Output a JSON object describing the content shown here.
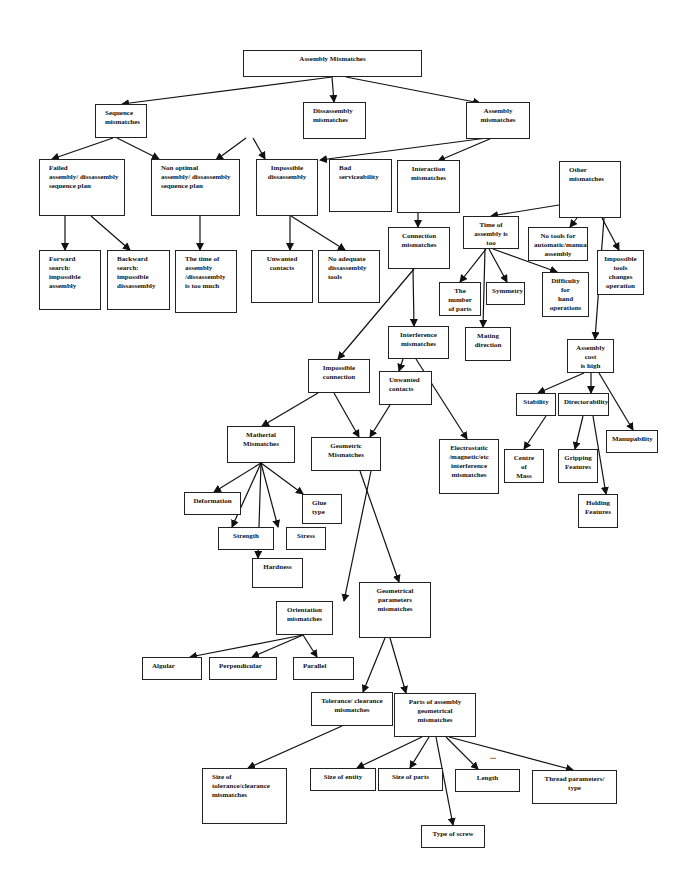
{
  "diagram": {
    "title": "Assembly Mismatches",
    "nodes": [
      {
        "id": "root",
        "label": "Assembly Mismatches",
        "x": 243,
        "y": 50,
        "w": 179,
        "h": 27,
        "align": "c"
      },
      {
        "id": "seq",
        "label": "Sequence\nmismatches",
        "x": 95,
        "y": 104,
        "w": 52,
        "h": 34,
        "align": "l"
      },
      {
        "id": "dis",
        "label": "Dissassembly\nmismatches",
        "x": 303,
        "y": 102,
        "w": 63,
        "h": 37,
        "align": "l"
      },
      {
        "id": "asm",
        "label": "Assembly\nmismatches",
        "x": 466,
        "y": 102,
        "w": 64,
        "h": 37,
        "align": "c"
      },
      {
        "id": "failed",
        "label": "Failed\nassembly/ dissassembly\nsequence plan",
        "x": 39,
        "y": 159,
        "w": 86,
        "h": 57,
        "align": "l"
      },
      {
        "id": "nonopt",
        "label": "Non optimal\nassembly/ dissassembly\nsequence plan",
        "x": 151,
        "y": 159,
        "w": 89,
        "h": 57,
        "align": "l"
      },
      {
        "id": "impdis",
        "label": "Impossible\ndissassembly",
        "x": 256,
        "y": 159,
        "w": 62,
        "h": 57,
        "align": "c"
      },
      {
        "id": "badserv",
        "label": "Bad\nserviceability",
        "x": 329,
        "y": 159,
        "w": 63,
        "h": 53,
        "align": "l"
      },
      {
        "id": "inter",
        "label": "Interaction\nmismatches",
        "x": 397,
        "y": 160,
        "w": 63,
        "h": 53,
        "align": "c"
      },
      {
        "id": "other",
        "label": "Other\nmismatches",
        "x": 559,
        "y": 161,
        "w": 62,
        "h": 57,
        "align": "l"
      },
      {
        "id": "fwd",
        "label": "Forward\nsearch:\nimpossible\nassembly",
        "x": 39,
        "y": 250,
        "w": 62,
        "h": 60,
        "align": "l"
      },
      {
        "id": "bwd",
        "label": "Backward\nsearch:\nimpossible\ndissassembly",
        "x": 107,
        "y": 250,
        "w": 63,
        "h": 60,
        "align": "l"
      },
      {
        "id": "timedis",
        "label": "The time of\nassembly\n/dissassembly\nis too much",
        "x": 175,
        "y": 250,
        "w": 62,
        "h": 63,
        "align": "l"
      },
      {
        "id": "unwcont1",
        "label": "Unwanted\ncontacts",
        "x": 251,
        "y": 250,
        "w": 62,
        "h": 53,
        "align": "c"
      },
      {
        "id": "noadeq",
        "label": "No adequate\ndissassembly\ntools",
        "x": 318,
        "y": 250,
        "w": 62,
        "h": 53,
        "align": "l"
      },
      {
        "id": "conn",
        "label": "Connection\nmismatches",
        "x": 388,
        "y": 227,
        "w": 62,
        "h": 42,
        "align": "c"
      },
      {
        "id": "timeasm",
        "label": "Time of\nassembly is too\nmuch",
        "x": 463,
        "y": 216,
        "w": 56,
        "h": 33,
        "align": "c"
      },
      {
        "id": "notools",
        "label": "No tools for\nautomatic/manual\nassembly",
        "x": 528,
        "y": 227,
        "w": 60,
        "h": 34,
        "align": "c"
      },
      {
        "id": "imptools",
        "label": "Impossible\ntools changes\noperation",
        "x": 597,
        "y": 250,
        "w": 47,
        "h": 45,
        "align": "c"
      },
      {
        "id": "numparts",
        "label": "The number\nof parts",
        "x": 439,
        "y": 282,
        "w": 42,
        "h": 34,
        "align": "c"
      },
      {
        "id": "symm",
        "label": "Symmetry",
        "x": 486,
        "y": 282,
        "w": 39,
        "h": 23,
        "align": "c"
      },
      {
        "id": "diffhand",
        "label": "Difficulty  for\nhand\noperations",
        "x": 542,
        "y": 272,
        "w": 47,
        "h": 45,
        "align": "c"
      },
      {
        "id": "mating",
        "label": "Mating\ndirection",
        "x": 465,
        "y": 327,
        "w": 46,
        "h": 34,
        "align": "c"
      },
      {
        "id": "interf",
        "label": "Interference\nmismatches",
        "x": 388,
        "y": 326,
        "w": 61,
        "h": 33,
        "align": "c"
      },
      {
        "id": "impconn",
        "label": "Impossible\nconnection",
        "x": 308,
        "y": 359,
        "w": 62,
        "h": 34,
        "align": "c"
      },
      {
        "id": "unwcont2",
        "label": "Unwanted\ncontacts",
        "x": 379,
        "y": 371,
        "w": 53,
        "h": 34,
        "align": "l"
      },
      {
        "id": "cost",
        "label": "Assembly cost\nis high",
        "x": 567,
        "y": 339,
        "w": 47,
        "h": 34,
        "align": "c"
      },
      {
        "id": "stab",
        "label": "Stability",
        "x": 516,
        "y": 393,
        "w": 40,
        "h": 23,
        "align": "c"
      },
      {
        "id": "direct",
        "label": "Directorability",
        "x": 558,
        "y": 393,
        "w": 51,
        "h": 23,
        "align": "c"
      },
      {
        "id": "manip",
        "label": "Manupability",
        "x": 606,
        "y": 430,
        "w": 52,
        "h": 23,
        "align": "c"
      },
      {
        "id": "centre",
        "label": "Centre of\nMass",
        "x": 504,
        "y": 449,
        "w": 40,
        "h": 34,
        "align": "c"
      },
      {
        "id": "gripping",
        "label": "Gripping\nFeatures",
        "x": 558,
        "y": 449,
        "w": 40,
        "h": 34,
        "align": "c"
      },
      {
        "id": "holding",
        "label": "Holding\nFeatures",
        "x": 578,
        "y": 494,
        "w": 40,
        "h": 34,
        "align": "c"
      },
      {
        "id": "mater",
        "label": "Matherial\nMismatches",
        "x": 227,
        "y": 426,
        "w": 68,
        "h": 37,
        "align": "c"
      },
      {
        "id": "geom",
        "label": "Geometric\nMismatches",
        "x": 311,
        "y": 437,
        "w": 70,
        "h": 34,
        "align": "c"
      },
      {
        "id": "electro",
        "label": "Electrostatic\n/magnetic/etc\ninterference\nmismatches",
        "x": 439,
        "y": 439,
        "w": 60,
        "h": 55,
        "align": "c"
      },
      {
        "id": "deform",
        "label": "Deformation",
        "x": 184,
        "y": 492,
        "w": 57,
        "h": 23,
        "align": "c"
      },
      {
        "id": "glue",
        "label": "Glue\ntype",
        "x": 302,
        "y": 494,
        "w": 40,
        "h": 30,
        "align": "l"
      },
      {
        "id": "strength",
        "label": "Strength",
        "x": 218,
        "y": 527,
        "w": 56,
        "h": 23,
        "align": "c"
      },
      {
        "id": "stress",
        "label": "Stress",
        "x": 286,
        "y": 527,
        "w": 40,
        "h": 23,
        "align": "c"
      },
      {
        "id": "hardness",
        "label": "Hardness",
        "x": 252,
        "y": 558,
        "w": 51,
        "h": 30,
        "align": "c"
      },
      {
        "id": "geompar",
        "label": "Geometrical\nparameters\nmismatches",
        "x": 359,
        "y": 582,
        "w": 72,
        "h": 56,
        "align": "c"
      },
      {
        "id": "orient",
        "label": "Orientation\nmismatches",
        "x": 276,
        "y": 601,
        "w": 57,
        "h": 34,
        "align": "c"
      },
      {
        "id": "angular",
        "label": "Algular",
        "x": 142,
        "y": 657,
        "w": 60,
        "h": 23,
        "align": "l"
      },
      {
        "id": "perp",
        "label": "Perpendicular",
        "x": 209,
        "y": 657,
        "w": 68,
        "h": 23,
        "align": "l"
      },
      {
        "id": "parallel",
        "label": "Parallel",
        "x": 293,
        "y": 657,
        "w": 61,
        "h": 23,
        "align": "l"
      },
      {
        "id": "tol",
        "label": "Tolerance/ clearance\nmismatches",
        "x": 311,
        "y": 692,
        "w": 82,
        "h": 34,
        "align": "c"
      },
      {
        "id": "parts",
        "label": "Parts of assembly\ngeometrical\nmismatches",
        "x": 394,
        "y": 693,
        "w": 82,
        "h": 44,
        "align": "c"
      },
      {
        "id": "sizetol",
        "label": "Size of\ntolerance/clearance\nmismatches",
        "x": 202,
        "y": 768,
        "w": 85,
        "h": 56,
        "align": "l"
      },
      {
        "id": "sizeent",
        "label": "Size of entity",
        "x": 310,
        "y": 768,
        "w": 66,
        "h": 23,
        "align": "c"
      },
      {
        "id": "sizeparts",
        "label": "Size of parts",
        "x": 378,
        "y": 768,
        "w": 65,
        "h": 23,
        "align": "c"
      },
      {
        "id": "length",
        "label": "Length",
        "x": 455,
        "y": 769,
        "w": 65,
        "h": 23,
        "align": "c"
      },
      {
        "id": "thread",
        "label": "Thread parameters/\ntype",
        "x": 532,
        "y": 770,
        "w": 85,
        "h": 34,
        "align": "c"
      },
      {
        "id": "screw",
        "label": "Type of screw",
        "x": 421,
        "y": 825,
        "w": 64,
        "h": 23,
        "align": "c"
      }
    ],
    "edges": [
      [
        332,
        77,
        122,
        104
      ],
      [
        332,
        77,
        334,
        102
      ],
      [
        346,
        77,
        480,
        103
      ],
      [
        113,
        138,
        52,
        159
      ],
      [
        117,
        138,
        159,
        159
      ],
      [
        246,
        138,
        216,
        160
      ],
      [
        253,
        138,
        265,
        159
      ],
      [
        487,
        138,
        320,
        160
      ],
      [
        492,
        138,
        438,
        161
      ],
      [
        65,
        216,
        65,
        250
      ],
      [
        91,
        216,
        130,
        250
      ],
      [
        200,
        216,
        200,
        250
      ],
      [
        290,
        216,
        290,
        250
      ],
      [
        291,
        216,
        345,
        250
      ],
      [
        418,
        213,
        418,
        227
      ],
      [
        559,
        205,
        491,
        216
      ],
      [
        577,
        218,
        570,
        227
      ],
      [
        602,
        218,
        619,
        250
      ],
      [
        486,
        249,
        460,
        282
      ],
      [
        489,
        249,
        507,
        282
      ],
      [
        493,
        249,
        557,
        272
      ],
      [
        485,
        249,
        483,
        327
      ],
      [
        413,
        269,
        414,
        326
      ],
      [
        414,
        269,
        338,
        359
      ],
      [
        604,
        218,
        595,
        339
      ],
      [
        584,
        373,
        538,
        393
      ],
      [
        591,
        373,
        591,
        393
      ],
      [
        599,
        373,
        633,
        430
      ],
      [
        546,
        416,
        524,
        449
      ],
      [
        583,
        416,
        575,
        449
      ],
      [
        593,
        416,
        606,
        494
      ],
      [
        403,
        359,
        399,
        371
      ],
      [
        416,
        359,
        467,
        439
      ],
      [
        318,
        393,
        262,
        426
      ],
      [
        334,
        393,
        359,
        437
      ],
      [
        390,
        405,
        370,
        437
      ],
      [
        261,
        463,
        214,
        492
      ],
      [
        261,
        463,
        232,
        527
      ],
      [
        261,
        463,
        278,
        527
      ],
      [
        261,
        463,
        303,
        494
      ],
      [
        261,
        463,
        258,
        558
      ],
      [
        371,
        471,
        344,
        601
      ],
      [
        360,
        471,
        399,
        582
      ],
      [
        303,
        635,
        190,
        657
      ],
      [
        303,
        635,
        252,
        657
      ],
      [
        303,
        635,
        317,
        657
      ],
      [
        385,
        638,
        363,
        692
      ],
      [
        390,
        638,
        406,
        693
      ],
      [
        342,
        726,
        248,
        768
      ],
      [
        422,
        737,
        357,
        768
      ],
      [
        429,
        737,
        410,
        768
      ],
      [
        446,
        737,
        478,
        769
      ],
      [
        449,
        737,
        573,
        770
      ],
      [
        436,
        737,
        453,
        825
      ]
    ],
    "ellipsis": {
      "text": "...",
      "x": 490,
      "y": 752
    }
  }
}
